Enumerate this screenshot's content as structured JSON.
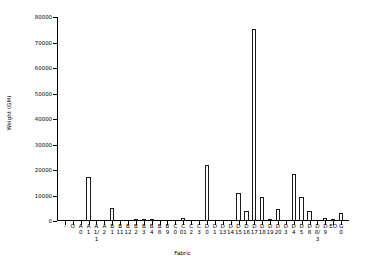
{
  "chart_data": {
    "type": "bar",
    "title": "",
    "xlabel": "Fabric",
    "ylabel": "Weight (GM)",
    "ylim": [
      0,
      80000
    ],
    "yticks": [
      0,
      10000,
      20000,
      30000,
      40000,
      50000,
      60000,
      70000,
      80000
    ],
    "ytick_labels": [
      "0",
      "10000",
      "20000",
      "30000",
      "40000",
      "50000",
      "60000",
      "70000",
      "80000"
    ],
    "grid": false,
    "legend": null,
    "bar_color": "#ffffff",
    "bar_edge_color": "#1a1a1a",
    "categories": [
      "-",
      "O",
      "A 0",
      "A 1",
      "A 1/1",
      "A 2",
      "B 1",
      "B 11",
      "B 12",
      "B 2",
      "B 3",
      "B 4",
      "B 8",
      "B 9",
      "C 0",
      "C 001",
      "C 2",
      "C 3",
      "D 0",
      "D 1",
      "D 13",
      "D 14",
      "D 15",
      "D 16",
      "D 17",
      "D 18",
      "D 19",
      "D 20",
      "D 3",
      "D 4",
      "D 5",
      "D 8",
      "D 8/3",
      "D 9",
      "E0",
      "G 0"
    ],
    "category_lines": [
      [
        "-",
        "",
        ""
      ],
      [
        "O",
        "",
        ""
      ],
      [
        "A",
        "0",
        ""
      ],
      [
        "A",
        "1",
        ""
      ],
      [
        "A",
        "1/",
        "1"
      ],
      [
        "A",
        "2",
        ""
      ],
      [
        "B",
        "1",
        ""
      ],
      [
        "B",
        "11",
        ""
      ],
      [
        "B",
        "12",
        ""
      ],
      [
        "B",
        "2",
        ""
      ],
      [
        "B",
        "3",
        ""
      ],
      [
        "B",
        "4",
        ""
      ],
      [
        "B",
        "8",
        ""
      ],
      [
        "B",
        "9",
        ""
      ],
      [
        "C",
        "0",
        ""
      ],
      [
        "C",
        "01",
        ""
      ],
      [
        "C",
        "2",
        ""
      ],
      [
        "C",
        "3",
        ""
      ],
      [
        "D",
        "0",
        ""
      ],
      [
        "D",
        "1",
        ""
      ],
      [
        "D",
        "13",
        ""
      ],
      [
        "D",
        "14",
        ""
      ],
      [
        "D",
        "15",
        ""
      ],
      [
        "D",
        "16",
        ""
      ],
      [
        "D",
        "17",
        ""
      ],
      [
        "D",
        "18",
        ""
      ],
      [
        "D",
        "19",
        ""
      ],
      [
        "D",
        "20",
        ""
      ],
      [
        "D",
        "3",
        ""
      ],
      [
        "D",
        "4",
        ""
      ],
      [
        "D",
        "5",
        ""
      ],
      [
        "D",
        "8",
        ""
      ],
      [
        "D",
        "8/",
        "3"
      ],
      [
        "D",
        "9",
        ""
      ],
      [
        "EO",
        "",
        ""
      ],
      [
        "G",
        "0",
        ""
      ]
    ],
    "values": [
      0,
      0,
      0,
      17300,
      0,
      0,
      5200,
      0,
      0,
      450,
      300,
      800,
      0,
      0,
      0,
      1100,
      0,
      0,
      21900,
      0,
      0,
      0,
      10800,
      4000,
      75200,
      9500,
      700,
      4600,
      0,
      18500,
      9500,
      4000,
      0,
      1100,
      500,
      3200
    ]
  }
}
